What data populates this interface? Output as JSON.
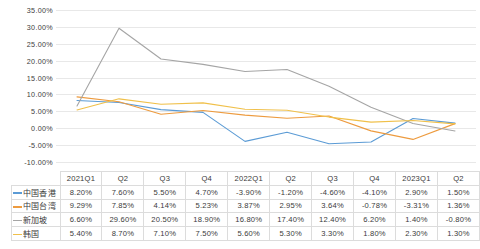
{
  "chart_data": {
    "type": "line",
    "title": "",
    "xlabel": "",
    "ylabel": "",
    "ylim": [
      -10,
      35
    ],
    "ytick_step": 5,
    "grid": true,
    "legend_position": "table-left",
    "categories": [
      "2021Q1",
      "Q2",
      "Q3",
      "Q4",
      "2022Q1",
      "Q2",
      "Q3",
      "Q4",
      "2023Q1",
      "Q2"
    ],
    "ytick_labels": [
      "35.00%",
      "30.00%",
      "25.00%",
      "20.00%",
      "15.00%",
      "10.00%",
      "5.00%",
      "0.00%",
      "-5.00%",
      "-10.00%"
    ],
    "series": [
      {
        "name": "中国香港",
        "color": "#5b9bd5",
        "values": [
          8.2,
          7.6,
          5.5,
          4.7,
          -3.9,
          -1.2,
          -4.6,
          -4.1,
          2.9,
          1.5
        ],
        "labels": [
          "8.20%",
          "7.60%",
          "5.50%",
          "4.70%",
          "-3.90%",
          "-1.20%",
          "-4.60%",
          "-4.10%",
          "2.90%",
          "1.50%"
        ]
      },
      {
        "name": "中国台湾",
        "color": "#ed9b3f",
        "values": [
          9.29,
          7.85,
          4.14,
          5.23,
          3.87,
          2.95,
          3.64,
          -0.78,
          -3.31,
          1.36
        ],
        "labels": [
          "9.29%",
          "7.85%",
          "4.14%",
          "5.23%",
          "3.87%",
          "2.95%",
          "3.64%",
          "-0.78%",
          "-3.31%",
          "1.36%"
        ]
      },
      {
        "name": "新加坡",
        "color": "#a5a5a5",
        "values": [
          6.6,
          29.6,
          20.5,
          18.9,
          16.8,
          17.4,
          12.4,
          6.2,
          1.4,
          -0.8
        ],
        "labels": [
          "6.60%",
          "29.60%",
          "20.50%",
          "18.90%",
          "16.80%",
          "17.40%",
          "12.40%",
          "6.20%",
          "1.40%",
          "-0.80%"
        ]
      },
      {
        "name": "韩国",
        "color": "#f0c04a",
        "values": [
          5.4,
          8.7,
          7.1,
          7.5,
          5.6,
          5.3,
          3.3,
          1.8,
          2.3,
          1.3
        ],
        "labels": [
          "5.40%",
          "8.70%",
          "7.10%",
          "7.50%",
          "5.60%",
          "5.30%",
          "3.30%",
          "1.80%",
          "2.30%",
          "1.30%"
        ]
      }
    ]
  },
  "table": {
    "corner_label": "",
    "headers": [
      "2021Q1",
      "Q2",
      "Q3",
      "Q4",
      "2022Q1",
      "Q2",
      "Q3",
      "Q4",
      "2023Q1",
      "Q2"
    ],
    "rows": [
      {
        "name": "中国香港",
        "color": "#5b9bd5",
        "cells": [
          "8.20%",
          "7.60%",
          "5.50%",
          "4.70%",
          "-3.90%",
          "-1.20%",
          "-4.60%",
          "-4.10%",
          "2.90%",
          "1.50%"
        ]
      },
      {
        "name": "中国台湾",
        "color": "#ed9b3f",
        "cells": [
          "9.29%",
          "7.85%",
          "4.14%",
          "5.23%",
          "3.87%",
          "2.95%",
          "3.64%",
          "-0.78%",
          "-3.31%",
          "1.36%"
        ]
      },
      {
        "name": "新加坡",
        "color": "#a5a5a5",
        "cells": [
          "6.60%",
          "29.60%",
          "20.50%",
          "18.90%",
          "16.80%",
          "17.40%",
          "12.40%",
          "6.20%",
          "1.40%",
          "-0.80%"
        ]
      },
      {
        "name": "韩国",
        "color": "#f0c04a",
        "cells": [
          "5.40%",
          "8.70%",
          "7.10%",
          "7.50%",
          "5.60%",
          "5.30%",
          "3.30%",
          "1.80%",
          "2.30%",
          "1.30%"
        ]
      }
    ]
  }
}
